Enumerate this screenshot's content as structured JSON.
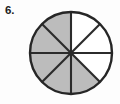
{
  "problem": {
    "number_label": "6.",
    "figure_type": "fraction-circle"
  },
  "chart_data": {
    "type": "pie",
    "title": "",
    "subtitle": "",
    "xlabel": "",
    "ylabel": "",
    "legend_position": "none",
    "grid": false,
    "total_sectors": 8,
    "sector_angle_degrees": 45,
    "shaded_count": 5,
    "unshaded_count": 3,
    "fraction_shaded": "5/8",
    "categories": [
      "sector-1",
      "sector-2",
      "sector-3",
      "sector-4",
      "sector-5",
      "sector-6",
      "sector-7",
      "sector-8"
    ],
    "values": [
      45,
      45,
      45,
      45,
      45,
      45,
      45,
      45
    ],
    "sectors": [
      {
        "index": 1,
        "start_deg": 0,
        "end_deg": 45,
        "shaded": false,
        "fill": "#ffffff"
      },
      {
        "index": 2,
        "start_deg": 45,
        "end_deg": 90,
        "shaded": false,
        "fill": "#ffffff"
      },
      {
        "index": 3,
        "start_deg": 90,
        "end_deg": 135,
        "shaded": false,
        "fill": "#ffffff"
      },
      {
        "index": 4,
        "start_deg": 135,
        "end_deg": 180,
        "shaded": true,
        "fill": "#bcbcbc"
      },
      {
        "index": 5,
        "start_deg": 180,
        "end_deg": 225,
        "shaded": true,
        "fill": "#bcbcbc"
      },
      {
        "index": 6,
        "start_deg": 225,
        "end_deg": 270,
        "shaded": true,
        "fill": "#bcbcbc"
      },
      {
        "index": 7,
        "start_deg": 270,
        "end_deg": 315,
        "shaded": true,
        "fill": "#bcbcbc"
      },
      {
        "index": 8,
        "start_deg": 315,
        "end_deg": 360,
        "shaded": true,
        "fill": "#bcbcbc"
      }
    ],
    "colors": {
      "shaded_fill": "#bcbcbc",
      "unshaded_fill": "#ffffff",
      "outline": "#262626",
      "divider": "#2b2b2b",
      "background": "#fdfdfd",
      "label_text": "#1d1d1d"
    },
    "geometry": {
      "center_x": 44,
      "center_y": 45,
      "radius": 41
    }
  }
}
